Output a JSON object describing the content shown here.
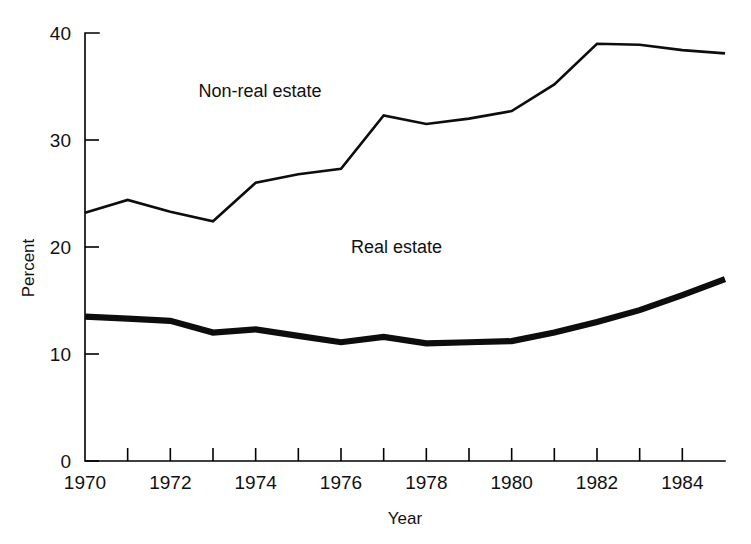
{
  "chart_data": {
    "type": "line",
    "title": "",
    "xlabel": "Year",
    "ylabel": "Percent",
    "xlim": [
      1970,
      1985
    ],
    "ylim": [
      0,
      40
    ],
    "grid": false,
    "legend_position": "inline-annotations",
    "x": [
      1970,
      1971,
      1972,
      1973,
      1974,
      1975,
      1976,
      1977,
      1978,
      1979,
      1980,
      1981,
      1982,
      1983,
      1984,
      1985
    ],
    "x_tick_values": [
      1970,
      1971,
      1972,
      1973,
      1974,
      1975,
      1976,
      1977,
      1978,
      1979,
      1980,
      1981,
      1982,
      1983,
      1984,
      1985
    ],
    "x_tick_labels": [
      "1970",
      "",
      "1972",
      "",
      "1974",
      "",
      "1976",
      "",
      "1978",
      "",
      "1980",
      "",
      "1982",
      "",
      "1984",
      ""
    ],
    "y_tick_values": [
      0,
      10,
      20,
      30,
      40
    ],
    "y_tick_labels": [
      "0",
      "10",
      "20",
      "30",
      "40"
    ],
    "series": [
      {
        "name": "Non-real estate",
        "style": "thin",
        "values": [
          23.2,
          24.4,
          23.3,
          22.4,
          26.0,
          26.8,
          27.3,
          32.3,
          31.5,
          32.0,
          32.7,
          35.2,
          39.0,
          38.9,
          38.4,
          38.1
        ]
      },
      {
        "name": "Real estate",
        "style": "thick",
        "values": [
          13.5,
          13.3,
          13.1,
          12.0,
          12.3,
          11.7,
          11.1,
          11.6,
          11.0,
          11.1,
          11.2,
          12.0,
          13.0,
          14.1,
          15.5,
          17.0
        ]
      }
    ],
    "annotations": [
      {
        "text": "Non-real estate",
        "x": 1974.1,
        "y": 34.0
      },
      {
        "text": "Real estate",
        "x": 1977.3,
        "y": 19.4
      }
    ],
    "colors": {
      "line": "#0d0d0d",
      "axis": "#000000",
      "text": "#111111",
      "background": "#ffffff"
    }
  }
}
